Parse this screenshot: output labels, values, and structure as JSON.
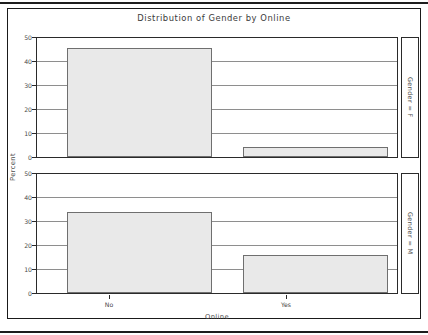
{
  "chart_data": {
    "type": "bar",
    "title": "Distribution of Gender by Online",
    "xlabel": "Online",
    "ylabel": "Percent",
    "categories": [
      "No",
      "Yes"
    ],
    "ylim": [
      0,
      50
    ],
    "yticks": [
      0,
      10,
      20,
      30,
      40,
      50
    ],
    "grid": true,
    "legend": "none",
    "panel_variable": "Gender",
    "panels": [
      {
        "label": "Gender = F",
        "values": [
          45.8,
          4.2
        ]
      },
      {
        "label": "Gender = M",
        "values": [
          34.2,
          15.8
        ]
      }
    ],
    "bar_fill": "#e9e9e9",
    "bar_border": "#6f6f6f"
  },
  "axis": {
    "y_tick_labels": [
      "50",
      "40",
      "30",
      "20",
      "10",
      "0"
    ],
    "x_tick_labels": [
      "No",
      "Yes"
    ]
  }
}
